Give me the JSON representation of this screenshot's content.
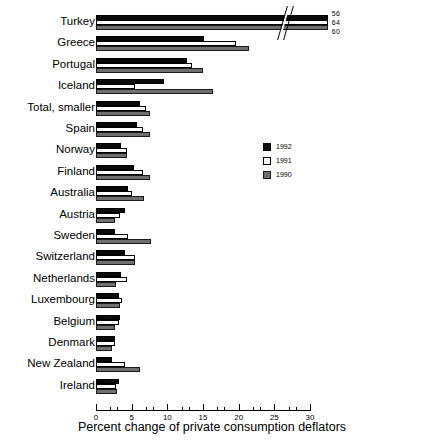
{
  "chart_data": {
    "type": "bar",
    "orientation": "horizontal",
    "title": "",
    "xlabel": "Percent change of private consumption deflators",
    "ylabel": "",
    "xlim": [
      0,
      30
    ],
    "xticks": [
      0,
      5,
      10,
      15,
      20,
      25,
      30
    ],
    "xtick_labels": [
      "0",
      "5",
      "10",
      "15",
      "20",
      "25",
      "30"
    ],
    "minor_ticks": true,
    "grid": false,
    "axis_break": true,
    "axis_break_note": "Turkey bars exceed the 30% axis limit and are drawn with a break; their true values are labelled at the bar ends.",
    "legend_position": "center-right",
    "categories": [
      "Turkey",
      "Greece",
      "Portugal",
      "Iceland",
      "Total, smaller",
      "Spain",
      "Norway",
      "Finland",
      "Australia",
      "Austria",
      "Sweden",
      "Switzerland",
      "Netherlands",
      "Luxembourg",
      "Belgium",
      "Denmark",
      "New Zealand",
      "Ireland"
    ],
    "series": [
      {
        "name": "1992",
        "color": "#0a0a0a",
        "values": [
          56.0,
          15.2,
          12.8,
          9.6,
          6.2,
          5.8,
          3.5,
          5.3,
          4.5,
          4.1,
          2.7,
          4.1,
          3.5,
          3.2,
          3.3,
          2.6,
          2.3,
          3.2
        ]
      },
      {
        "name": "1991",
        "color": "#ffffff",
        "values": [
          64.0,
          19.6,
          13.5,
          5.5,
          7.0,
          6.6,
          4.3,
          6.6,
          5.0,
          3.4,
          4.5,
          5.4,
          4.3,
          3.6,
          3.2,
          2.6,
          4.1,
          2.8
        ]
      },
      {
        "name": "1990",
        "color": "#6f6f6f",
        "values": [
          60.0,
          21.5,
          15.0,
          16.4,
          7.6,
          7.6,
          4.3,
          7.5,
          6.7,
          2.6,
          7.7,
          5.5,
          2.8,
          3.3,
          2.6,
          2.3,
          6.2,
          3.0
        ]
      }
    ],
    "value_labels": {
      "Turkey": {
        "1992": "56",
        "1991": "64",
        "1990": "60"
      }
    }
  },
  "legend": {
    "items": [
      {
        "label": "1992",
        "swatch": "black-filled-square"
      },
      {
        "label": "1991",
        "swatch": "white-outline-square"
      },
      {
        "label": "1990",
        "swatch": "gray-filled-square"
      }
    ]
  }
}
